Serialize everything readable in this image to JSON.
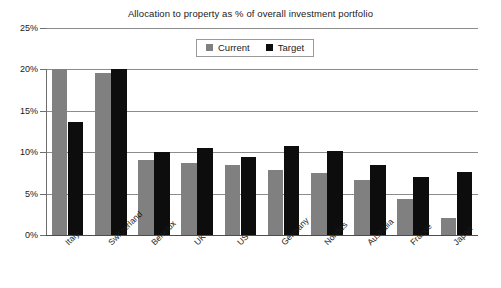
{
  "chart_data": {
    "type": "bar",
    "title": "Allocation to property as % of overall investment portfolio",
    "xlabel": "",
    "ylabel": "",
    "ylim": [
      0,
      25
    ],
    "yticks": [
      "0%",
      "5%",
      "10%",
      "15%",
      "20%",
      "25%"
    ],
    "ytick_values": [
      0,
      5,
      10,
      15,
      20,
      25
    ],
    "grid": true,
    "legend_position": "top-center",
    "categories": [
      "Italy",
      "Switzerland",
      "Benelux",
      "UK",
      "US",
      "Germany",
      "Nordics",
      "Australia",
      "France",
      "Japan"
    ],
    "series": [
      {
        "name": "Current",
        "color": "#808080",
        "values": [
          20.0,
          19.6,
          9.0,
          8.7,
          8.5,
          7.8,
          7.5,
          6.7,
          4.4,
          2.1
        ]
      },
      {
        "name": "Target",
        "color": "#0d0d0d",
        "values": [
          13.7,
          20.1,
          10.0,
          10.5,
          9.4,
          10.7,
          10.2,
          8.5,
          7.0,
          7.6
        ]
      }
    ]
  },
  "legend": {
    "items": [
      {
        "label": "Current",
        "swatch": "current"
      },
      {
        "label": "Target",
        "swatch": "target"
      }
    ]
  }
}
